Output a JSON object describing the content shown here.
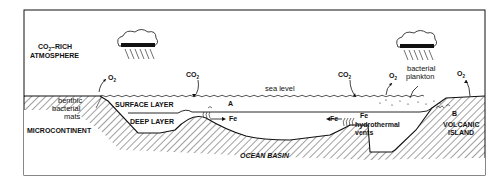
{
  "diagram": {
    "labels": {
      "atmosphere_line1": "CO",
      "atmosphere_sub": "2",
      "atmosphere_line1_rest": "–RICH",
      "atmosphere_line2": "ATMOSPHERE",
      "o2_left": "O",
      "co2_center": "CO",
      "sea_level": "sea level",
      "surface_layer": "SURFACE LAYER",
      "deep_layer": "DEEP LAYER",
      "point_a": "A",
      "point_b": "B",
      "fe_left": "Fe",
      "fe_right_arrow": "Fe",
      "fe_vent": "Fe",
      "hydrothermal_line1": "hydrothermal",
      "hydrothermal_line2": "vents",
      "co2_right": "CO",
      "o2_mid": "O",
      "o2_right": "O",
      "plankton_line1": "bacterial",
      "plankton_line2": "plankton",
      "benthic_line1": "benthic",
      "benthic_line2": "bacterial",
      "benthic_line3": "mats",
      "microcontinent": "MICROCONTINENT",
      "volcanic_line1": "VOLCANIC",
      "volcanic_line2": "ISLAND",
      "ocean_basin": "OCEAN BASIN",
      "subscript_2": "2"
    },
    "colors": {
      "ink": "#111111",
      "background": "#ffffff"
    }
  }
}
